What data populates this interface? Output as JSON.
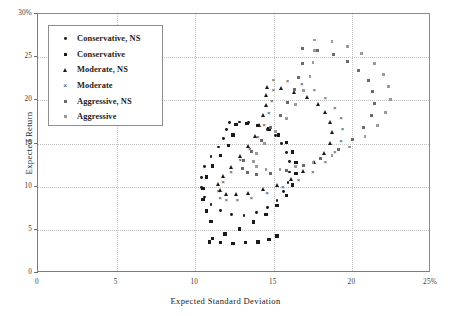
{
  "chart_data": {
    "type": "scatter",
    "title": "",
    "xlabel": "Expected Standard Deviation",
    "ylabel": "Expected Return",
    "xlim": [
      0,
      25
    ],
    "ylim": [
      0,
      30
    ],
    "xticks": [
      "0",
      "5",
      "10",
      "15",
      "20",
      "25%"
    ],
    "xtick_values": [
      0,
      5,
      10,
      15,
      20,
      25
    ],
    "yticks": [
      "0",
      "5",
      "10",
      "15",
      "20",
      "25",
      "30%"
    ],
    "ytick_values": [
      0,
      5,
      10,
      15,
      20,
      25,
      30
    ],
    "grid": true,
    "grid_style": "dotted",
    "legend_position": "upper-left-inset",
    "series": [
      {
        "name": "Conservative, NS",
        "marker": "dot",
        "color": "#1a1a1a",
        "points": [
          [
            12.2,
            17.4
          ],
          [
            12.8,
            17.5
          ],
          [
            13.4,
            17.4
          ],
          [
            14.0,
            17.1
          ],
          [
            14.6,
            16.6
          ],
          [
            15.1,
            15.9
          ],
          [
            15.5,
            15.0
          ],
          [
            15.8,
            14.0
          ],
          [
            16.0,
            12.9
          ],
          [
            16.0,
            11.7
          ],
          [
            15.9,
            10.5
          ],
          [
            15.6,
            9.4
          ],
          [
            15.2,
            8.4
          ],
          [
            14.6,
            7.6
          ],
          [
            13.9,
            7.0
          ],
          [
            13.1,
            6.7
          ],
          [
            12.3,
            6.8
          ],
          [
            11.6,
            7.2
          ],
          [
            11.0,
            7.9
          ],
          [
            10.6,
            8.8
          ],
          [
            10.4,
            9.9
          ],
          [
            10.4,
            11.1
          ],
          [
            10.6,
            12.3
          ],
          [
            11.0,
            13.5
          ],
          [
            11.5,
            14.6
          ],
          [
            11.8,
            15.6
          ],
          [
            12.0,
            16.6
          ]
        ]
      },
      {
        "name": "Conservative",
        "marker": "square",
        "color": "#1a1a1a",
        "points": [
          [
            12.6,
            17.2
          ],
          [
            13.3,
            17.3
          ],
          [
            14.0,
            17.1
          ],
          [
            14.7,
            16.7
          ],
          [
            15.3,
            16.0
          ],
          [
            15.8,
            15.1
          ],
          [
            16.2,
            14.0
          ],
          [
            16.4,
            12.8
          ],
          [
            16.4,
            11.5
          ],
          [
            16.2,
            10.2
          ],
          [
            15.8,
            9.0
          ],
          [
            15.2,
            7.8
          ],
          [
            14.5,
            6.8
          ],
          [
            13.7,
            5.9
          ],
          [
            12.8,
            5.1
          ],
          [
            11.9,
            4.5
          ],
          [
            11.1,
            4.0
          ],
          [
            10.9,
            3.6
          ],
          [
            11.6,
            3.5
          ],
          [
            12.4,
            3.4
          ],
          [
            13.2,
            3.5
          ],
          [
            14.0,
            3.6
          ],
          [
            14.7,
            3.9
          ],
          [
            15.2,
            4.3
          ],
          [
            11.0,
            6.0
          ],
          [
            10.7,
            7.2
          ],
          [
            10.5,
            8.5
          ],
          [
            10.5,
            9.8
          ],
          [
            10.7,
            11.1
          ],
          [
            11.1,
            12.4
          ],
          [
            11.6,
            13.6
          ],
          [
            12.1,
            14.8
          ],
          [
            12.4,
            16.0
          ]
        ]
      },
      {
        "name": "Moderate, NS",
        "marker": "triangle",
        "color": "#1a1a1a",
        "points": [
          [
            14.6,
            21.6
          ],
          [
            15.5,
            21.4
          ],
          [
            16.3,
            21.0
          ],
          [
            17.1,
            20.4
          ],
          [
            17.8,
            19.6
          ],
          [
            18.3,
            18.6
          ],
          [
            18.6,
            17.5
          ],
          [
            18.7,
            16.3
          ],
          [
            18.6,
            15.1
          ],
          [
            18.2,
            13.9
          ],
          [
            17.6,
            12.8
          ],
          [
            16.9,
            11.8
          ],
          [
            16.1,
            10.9
          ],
          [
            15.2,
            10.2
          ],
          [
            14.3,
            9.7
          ],
          [
            13.4,
            9.3
          ],
          [
            12.6,
            9.1
          ],
          [
            12.0,
            9.2
          ],
          [
            11.6,
            9.6
          ],
          [
            11.5,
            10.3
          ],
          [
            11.8,
            11.2
          ],
          [
            12.3,
            12.3
          ],
          [
            12.9,
            13.5
          ],
          [
            13.4,
            14.7
          ],
          [
            13.8,
            15.9
          ],
          [
            14.1,
            17.1
          ],
          [
            14.3,
            18.3
          ],
          [
            14.5,
            19.5
          ],
          [
            14.5,
            20.6
          ]
        ]
      },
      {
        "name": "Moderate",
        "marker": "x",
        "color": "#2a2a2a",
        "points": [
          [
            15.0,
            22.4
          ],
          [
            15.9,
            22.3
          ],
          [
            16.8,
            21.9
          ],
          [
            17.6,
            21.2
          ],
          [
            18.3,
            20.3
          ],
          [
            18.9,
            19.2
          ],
          [
            19.3,
            18.0
          ],
          [
            19.4,
            16.7
          ],
          [
            19.3,
            15.4
          ],
          [
            18.9,
            14.1
          ],
          [
            18.3,
            12.9
          ],
          [
            17.5,
            11.8
          ],
          [
            16.6,
            10.8
          ],
          [
            15.6,
            10.0
          ],
          [
            14.6,
            9.3
          ],
          [
            13.6,
            8.8
          ],
          [
            12.7,
            8.5
          ],
          [
            12.0,
            8.5
          ],
          [
            11.6,
            8.8
          ],
          [
            11.5,
            9.5
          ],
          [
            11.8,
            10.6
          ],
          [
            12.3,
            11.8
          ],
          [
            12.9,
            13.1
          ],
          [
            13.5,
            14.4
          ],
          [
            14.0,
            15.8
          ],
          [
            14.4,
            17.2
          ],
          [
            14.7,
            18.6
          ],
          [
            14.9,
            20.0
          ],
          [
            15.0,
            21.3
          ]
        ]
      },
      {
        "name": "Aggressive, NS",
        "marker": "square-open",
        "color": "#6a6a6a",
        "points": [
          [
            16.8,
            26.0
          ],
          [
            17.8,
            25.8
          ],
          [
            18.8,
            25.3
          ],
          [
            19.7,
            24.5
          ],
          [
            20.4,
            23.5
          ],
          [
            21.0,
            22.3
          ],
          [
            21.3,
            21.0
          ],
          [
            21.4,
            19.6
          ],
          [
            21.2,
            18.2
          ],
          [
            20.7,
            16.8
          ],
          [
            20.0,
            15.5
          ],
          [
            19.1,
            14.3
          ],
          [
            18.0,
            13.3
          ],
          [
            16.9,
            12.5
          ],
          [
            15.8,
            11.9
          ],
          [
            14.8,
            11.5
          ],
          [
            13.9,
            11.4
          ],
          [
            13.3,
            11.6
          ],
          [
            13.0,
            12.1
          ],
          [
            13.1,
            13.0
          ],
          [
            13.6,
            14.1
          ],
          [
            14.2,
            15.4
          ],
          [
            14.8,
            16.8
          ],
          [
            15.4,
            18.2
          ],
          [
            15.9,
            19.7
          ],
          [
            16.3,
            21.2
          ],
          [
            16.6,
            22.7
          ],
          [
            16.8,
            24.3
          ]
        ]
      },
      {
        "name": "Aggressive",
        "marker": "square-light",
        "color": "#9a9a9a",
        "points": [
          [
            17.6,
            27.0
          ],
          [
            18.7,
            26.8
          ],
          [
            19.7,
            26.2
          ],
          [
            20.6,
            25.4
          ],
          [
            21.4,
            24.3
          ],
          [
            22.0,
            23.0
          ],
          [
            22.3,
            21.6
          ],
          [
            22.4,
            20.1
          ],
          [
            22.1,
            18.6
          ],
          [
            21.6,
            17.1
          ],
          [
            20.8,
            15.8
          ],
          [
            19.8,
            14.6
          ],
          [
            18.7,
            13.6
          ],
          [
            17.5,
            12.8
          ],
          [
            16.4,
            12.3
          ],
          [
            15.4,
            12.0
          ],
          [
            14.5,
            12.0
          ],
          [
            13.9,
            12.3
          ],
          [
            13.7,
            12.9
          ],
          [
            13.9,
            13.8
          ],
          [
            14.4,
            15.0
          ],
          [
            15.1,
            16.4
          ],
          [
            15.8,
            17.9
          ],
          [
            16.4,
            19.5
          ],
          [
            16.9,
            21.1
          ],
          [
            17.3,
            22.8
          ],
          [
            17.5,
            24.4
          ],
          [
            17.6,
            25.8
          ]
        ]
      }
    ]
  },
  "legend": {
    "items": [
      {
        "label": "Conservative, NS",
        "marker": "dot"
      },
      {
        "label": "Conservative",
        "marker": "square"
      },
      {
        "label": "Moderate, NS",
        "marker": "triangle"
      },
      {
        "label": "Moderate",
        "marker": "x"
      },
      {
        "label": "Aggressive, NS",
        "marker": "square-open"
      },
      {
        "label": "Aggressive",
        "marker": "square-light"
      }
    ]
  }
}
